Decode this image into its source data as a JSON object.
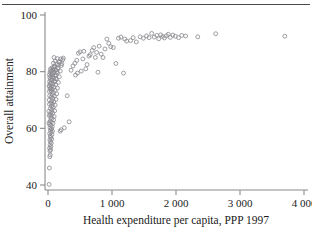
{
  "figure": {
    "background_color": "#ffffff",
    "rule_color": "#4a4a4a",
    "axis_color": "#8a8a8a",
    "marker_color": "#8d8d92"
  },
  "chart_data": {
    "type": "scatter",
    "title": "",
    "xlabel": "Health expenditure per capita, PPP 1997",
    "ylabel": "Overall attainment",
    "xlim": [
      0,
      4000
    ],
    "ylim": [
      38,
      101
    ],
    "grid": false,
    "legend": null,
    "marker": "open-circle",
    "xticks": [
      0,
      1000,
      2000,
      3000,
      4000
    ],
    "xticklabels": [
      "0",
      "1 000",
      "2 000",
      "3 000",
      "4 000"
    ],
    "yticks": [
      40,
      60,
      80,
      100
    ],
    "yticklabels": [
      "40",
      "60",
      "80",
      "100"
    ],
    "n_points": 176,
    "points": [
      [
        18,
        40.2
      ],
      [
        22,
        46.0
      ],
      [
        28,
        50.0
      ],
      [
        34,
        50.6
      ],
      [
        30,
        52.0
      ],
      [
        40,
        52.4
      ],
      [
        25,
        53.0
      ],
      [
        45,
        53.5
      ],
      [
        33,
        54.2
      ],
      [
        52,
        54.8
      ],
      [
        38,
        55.3
      ],
      [
        29,
        55.9
      ],
      [
        58,
        56.2
      ],
      [
        44,
        56.8
      ],
      [
        35,
        57.3
      ],
      [
        62,
        57.8
      ],
      [
        27,
        58.2
      ],
      [
        49,
        58.6
      ],
      [
        70,
        59.0
      ],
      [
        39,
        59.4
      ],
      [
        56,
        59.8
      ],
      [
        31,
        60.2
      ],
      [
        66,
        60.6
      ],
      [
        43,
        61.0
      ],
      [
        24,
        61.4
      ],
      [
        78,
        61.8
      ],
      [
        51,
        62.2
      ],
      [
        36,
        62.6
      ],
      [
        88,
        63.0
      ],
      [
        60,
        63.4
      ],
      [
        42,
        63.8
      ],
      [
        96,
        64.2
      ],
      [
        55,
        64.6
      ],
      [
        33,
        65.0
      ],
      [
        72,
        65.4
      ],
      [
        47,
        65.8
      ],
      [
        104,
        66.2
      ],
      [
        63,
        66.6
      ],
      [
        38,
        67.0
      ],
      [
        82,
        67.4
      ],
      [
        54,
        67.8
      ],
      [
        112,
        68.2
      ],
      [
        69,
        68.6
      ],
      [
        44,
        69.0
      ],
      [
        92,
        69.4
      ],
      [
        59,
        69.8
      ],
      [
        124,
        70.2
      ],
      [
        76,
        70.6
      ],
      [
        48,
        71.0
      ],
      [
        100,
        71.4
      ],
      [
        66,
        71.8
      ],
      [
        136,
        72.2
      ],
      [
        84,
        72.6
      ],
      [
        53,
        73.0
      ],
      [
        110,
        73.4
      ],
      [
        72,
        73.8
      ],
      [
        148,
        74.2
      ],
      [
        92,
        74.6
      ],
      [
        58,
        75.0
      ],
      [
        120,
        75.4
      ],
      [
        79,
        75.8
      ],
      [
        162,
        76.2
      ],
      [
        101,
        76.6
      ],
      [
        64,
        77.0
      ],
      [
        132,
        77.4
      ],
      [
        87,
        77.8
      ],
      [
        176,
        78.2
      ],
      [
        111,
        78.6
      ],
      [
        70,
        79.0
      ],
      [
        144,
        79.4
      ],
      [
        95,
        79.8
      ],
      [
        192,
        80.2
      ],
      [
        122,
        80.6
      ],
      [
        77,
        81.0
      ],
      [
        158,
        81.4
      ],
      [
        104,
        81.8
      ],
      [
        210,
        82.2
      ],
      [
        134,
        82.6
      ],
      [
        85,
        83.0
      ],
      [
        172,
        83.4
      ],
      [
        114,
        83.8
      ],
      [
        230,
        84.2
      ],
      [
        147,
        84.6
      ],
      [
        94,
        85.0
      ],
      [
        16,
        62.0
      ],
      [
        20,
        64.5
      ],
      [
        14,
        66.0
      ],
      [
        23,
        68.5
      ],
      [
        18,
        70.0
      ],
      [
        26,
        71.5
      ],
      [
        21,
        73.0
      ],
      [
        30,
        74.0
      ],
      [
        17,
        75.0
      ],
      [
        34,
        75.8
      ],
      [
        25,
        76.5
      ],
      [
        38,
        77.2
      ],
      [
        29,
        77.9
      ],
      [
        43,
        78.4
      ],
      [
        22,
        78.9
      ],
      [
        47,
        79.3
      ],
      [
        32,
        79.8
      ],
      [
        52,
        80.3
      ],
      [
        37,
        80.8
      ],
      [
        57,
        81.3
      ],
      [
        27,
        74.8
      ],
      [
        41,
        74.2
      ],
      [
        46,
        73.5
      ],
      [
        50,
        76.0
      ],
      [
        61,
        77.0
      ],
      [
        67,
        78.0
      ],
      [
        73,
        79.5
      ],
      [
        80,
        80.5
      ],
      [
        90,
        81.5
      ],
      [
        99,
        82.0
      ],
      [
        108,
        76.5
      ],
      [
        117,
        77.5
      ],
      [
        126,
        78.8
      ],
      [
        140,
        80.0
      ],
      [
        155,
        81.0
      ],
      [
        168,
        82.5
      ],
      [
        183,
        83.5
      ],
      [
        198,
        84.5
      ],
      [
        215,
        82.8
      ],
      [
        240,
        84.8
      ],
      [
        190,
        59.0
      ],
      [
        205,
        59.5
      ],
      [
        255,
        60.2
      ],
      [
        330,
        62.3
      ],
      [
        300,
        71.5
      ],
      [
        360,
        80.5
      ],
      [
        390,
        82.0
      ],
      [
        420,
        83.0
      ],
      [
        450,
        84.0
      ],
      [
        475,
        86.5
      ],
      [
        500,
        87.0
      ],
      [
        430,
        78.8
      ],
      [
        460,
        79.5
      ],
      [
        520,
        80.2
      ],
      [
        545,
        84.5
      ],
      [
        560,
        87.2
      ],
      [
        590,
        81.0
      ],
      [
        610,
        82.5
      ],
      [
        640,
        85.5
      ],
      [
        660,
        86.0
      ],
      [
        690,
        87.5
      ],
      [
        715,
        88.5
      ],
      [
        740,
        85.0
      ],
      [
        760,
        86.8
      ],
      [
        780,
        79.8
      ],
      [
        800,
        89.0
      ],
      [
        830,
        86.2
      ],
      [
        860,
        85.0
      ],
      [
        890,
        88.0
      ],
      [
        920,
        91.5
      ],
      [
        950,
        90.0
      ],
      [
        980,
        88.8
      ],
      [
        1020,
        88.5
      ],
      [
        1060,
        82.9
      ],
      [
        1100,
        91.8
      ],
      [
        1140,
        92.2
      ],
      [
        1180,
        79.5
      ],
      [
        1200,
        91.5
      ],
      [
        1230,
        90.8
      ],
      [
        1290,
        91.0
      ],
      [
        1330,
        92.0
      ],
      [
        1380,
        90.5
      ],
      [
        1440,
        92.3
      ],
      [
        1490,
        91.8
      ],
      [
        1540,
        92.6
      ],
      [
        1580,
        92.0
      ],
      [
        1620,
        93.5
      ],
      [
        1660,
        92.2
      ],
      [
        1700,
        92.8
      ],
      [
        1730,
        91.6
      ],
      [
        1760,
        93.0
      ],
      [
        1790,
        92.4
      ],
      [
        1820,
        91.9
      ],
      [
        1850,
        92.7
      ],
      [
        1880,
        93.2
      ],
      [
        1910,
        92.1
      ],
      [
        1950,
        92.9
      ],
      [
        1990,
        92.5
      ],
      [
        2040,
        92.0
      ],
      [
        2090,
        92.8
      ],
      [
        2150,
        92.6
      ],
      [
        2340,
        92.3
      ],
      [
        2620,
        93.4
      ],
      [
        3700,
        92.5
      ]
    ]
  }
}
